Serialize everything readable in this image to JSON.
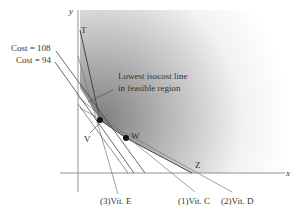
{
  "diagram": {
    "type": "linear-programming-isocost",
    "axes": {
      "x_label": "x",
      "y_label": "y"
    },
    "points": {
      "T": "T",
      "V": "V",
      "W": "W",
      "Z": "Z"
    },
    "cost_lines": [
      {
        "label": "Cost = 108"
      },
      {
        "label": "Cost = 94"
      }
    ],
    "annotation": {
      "line1": "Lowest isocost line",
      "line2": "in feasible region"
    },
    "constraints": [
      {
        "label": "(3)Vit. E"
      },
      {
        "label": "(1)Vit. C"
      },
      {
        "label": "(2)Vit. D"
      }
    ],
    "colors": {
      "feasible_region_dark": "#8c8c8c",
      "feasible_region_light": "#ffffff",
      "lines": "#555555",
      "points": "#111111"
    }
  }
}
